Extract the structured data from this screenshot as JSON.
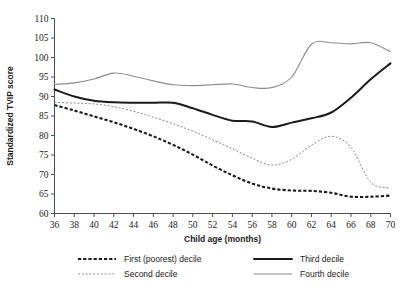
{
  "chart_data": {
    "type": "line",
    "title": "",
    "xlabel": "Child age (months)",
    "ylabel": "Standardized TVIP score",
    "xlim": [
      36,
      70
    ],
    "ylim": [
      60,
      110
    ],
    "xticks": [
      36,
      38,
      40,
      42,
      44,
      46,
      48,
      50,
      52,
      54,
      56,
      58,
      60,
      62,
      64,
      66,
      68,
      70
    ],
    "yticks": [
      60,
      65,
      70,
      75,
      80,
      85,
      90,
      95,
      100,
      105,
      110
    ],
    "grid": false,
    "legend_position": "bottom",
    "x": [
      36,
      38,
      40,
      42,
      44,
      46,
      48,
      50,
      52,
      54,
      56,
      58,
      60,
      62,
      64,
      66,
      68,
      70
    ],
    "series": [
      {
        "name": "First (poorest) decile",
        "style": "dashed-thick",
        "color": "#1a1a1a",
        "values": [
          87.8,
          86.4,
          84.9,
          83.4,
          81.7,
          79.8,
          77.6,
          75.1,
          72.3,
          69.8,
          67.7,
          66.4,
          65.9,
          65.8,
          65.3,
          64.3,
          64.3,
          64.6
        ]
      },
      {
        "name": "Second decile",
        "style": "dotted-thin",
        "color": "#8c8c8c",
        "values": [
          88.5,
          88.3,
          88.1,
          87.4,
          86.2,
          84.7,
          83.0,
          81.1,
          78.9,
          76.6,
          74.2,
          72.4,
          73.9,
          77.5,
          79.8,
          77.0,
          68.0,
          66.5
        ]
      },
      {
        "name": "Third decile",
        "style": "solid-thick",
        "color": "#1a1a1a",
        "values": [
          91.8,
          90.0,
          88.9,
          88.5,
          88.4,
          88.4,
          88.4,
          87.0,
          85.3,
          83.8,
          83.6,
          82.2,
          83.3,
          84.4,
          85.9,
          89.7,
          94.4,
          98.5
        ]
      },
      {
        "name": "Fourth decile",
        "style": "solid-thin",
        "color": "#8c8c8c",
        "values": [
          93.1,
          93.5,
          94.5,
          96.0,
          95.2,
          94.0,
          93.0,
          92.8,
          93.0,
          93.2,
          92.3,
          92.3,
          95.0,
          103.4,
          103.8,
          103.5,
          103.8,
          101.5
        ]
      }
    ]
  },
  "legend": {
    "items": [
      {
        "label": "First (poorest) decile"
      },
      {
        "label": "Second decile"
      },
      {
        "label": "Third decile"
      },
      {
        "label": "Fourth decile"
      }
    ]
  }
}
